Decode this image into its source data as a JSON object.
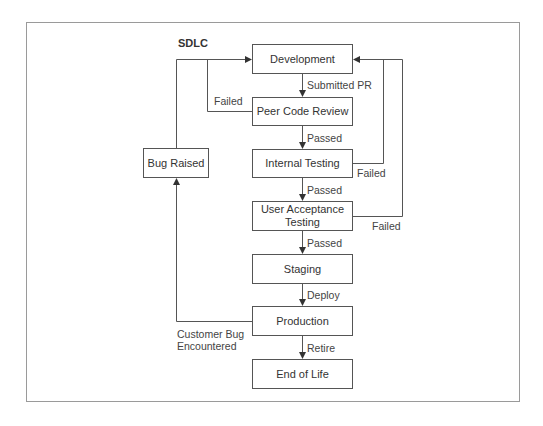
{
  "diagram": {
    "title": "SDLC",
    "nodes": {
      "development": "Development",
      "peer_review": "Peer Code Review",
      "internal_testing": "Internal Testing",
      "uat_line1": "User Acceptance",
      "uat_line2": "Testing",
      "staging": "Staging",
      "production": "Production",
      "end_of_life": "End of Life",
      "bug_raised": "Bug Raised"
    },
    "edges": {
      "submitted_pr": "Submitted PR",
      "review_passed": "Passed",
      "review_failed": "Failed",
      "internal_passed": "Passed",
      "internal_failed": "Failed",
      "uat_passed": "Passed",
      "uat_failed": "Failed",
      "deploy": "Deploy",
      "retire": "Retire",
      "customer_bug_line1": "Customer Bug",
      "customer_bug_line2": "Encountered"
    }
  }
}
